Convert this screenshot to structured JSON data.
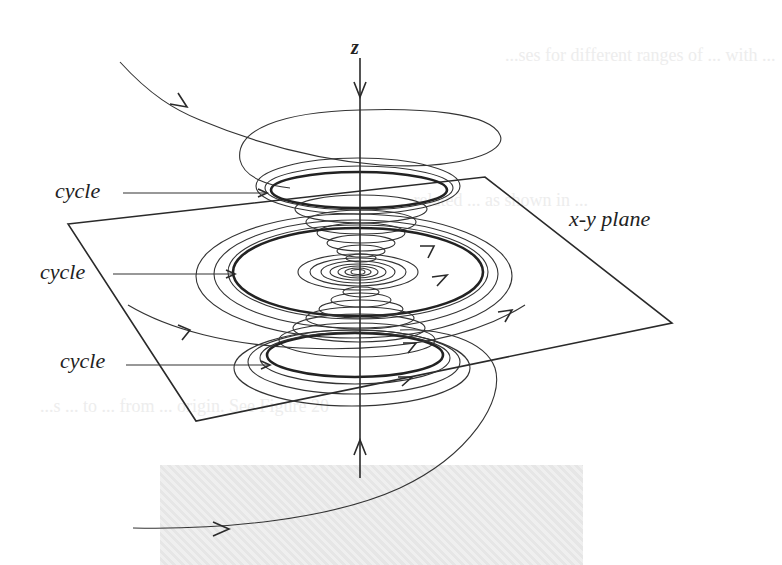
{
  "figure": {
    "axis_label": "z",
    "plane_label": "x-y plane",
    "cycle_labels": [
      "cycle",
      "cycle",
      "cycle"
    ],
    "background_text": {
      "line1": "...ses for different ranges of ... with ...",
      "line2": "...related ... as shown in ...",
      "line3": "...s ... to ... from ... origin. See Figure 20"
    }
  },
  "geometry": {
    "z_axis": {
      "x": 360,
      "y_top": 60,
      "y_bottom": 478
    },
    "plane_corners": [
      [
        68,
        224
      ],
      [
        485,
        177
      ],
      [
        672,
        323
      ],
      [
        196,
        421
      ]
    ],
    "cycles": [
      {
        "name": "top",
        "cx": 359,
        "cy": 190,
        "rx": 88,
        "ry": 18
      },
      {
        "name": "middle",
        "cx": 358,
        "cy": 272,
        "rx": 125,
        "ry": 44
      },
      {
        "name": "bottom",
        "cx": 355,
        "cy": 355,
        "rx": 88,
        "ry": 22
      }
    ]
  },
  "colors": {
    "ink": "#222222",
    "background": "#ffffff",
    "gray_box": "#e9e9e9"
  }
}
